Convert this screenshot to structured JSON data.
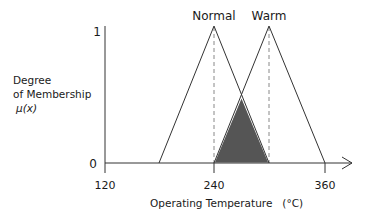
{
  "y_axis": {
    "label_line1": "Degree",
    "label_line2": "of Membership",
    "label_line3": "μ(x)",
    "tick_top": "1",
    "tick_bottom": "0"
  },
  "x_axis": {
    "label": "Operating Temperature   (°C)",
    "ticks": [
      "120",
      "240",
      "360"
    ]
  },
  "sets": [
    {
      "name": "Normal",
      "left": 180,
      "peak": 240,
      "right": 300
    },
    {
      "name": "Warm",
      "left": 240,
      "peak": 300,
      "right": 360
    }
  ],
  "overlap": {
    "from": 240,
    "to": 300,
    "peak_x": 270,
    "peak_mu": 0.5,
    "fill": "#555555"
  },
  "colors": {
    "line": "#333333",
    "dash": "#888888",
    "shade": "#555555"
  }
}
